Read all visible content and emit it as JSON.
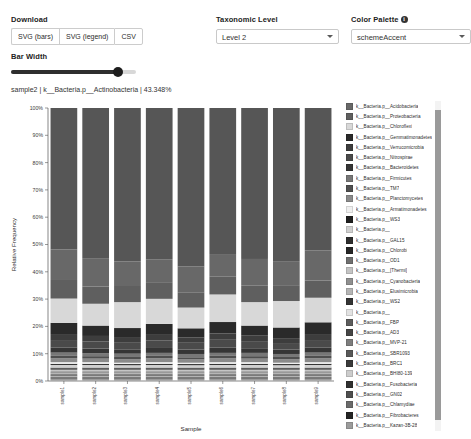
{
  "toolbar": {
    "download_label": "Download",
    "buttons": [
      {
        "label": "SVG (bars)",
        "name": "svg-bars"
      },
      {
        "label": "SVG (legend)",
        "name": "svg-legend"
      },
      {
        "label": "CSV",
        "name": "csv"
      }
    ],
    "bar_width_label": "Bar Width",
    "bar_width_value": "86",
    "taxonomic_level_label": "Taxonomic Level",
    "taxonomic_level_value": "Level 2",
    "color_palette_label": "Color Palette",
    "color_palette_value": "schemeAccent",
    "info_glyph": "i"
  },
  "status": {
    "text": "sample2 | k__Bacteria.p__Actinobacteria | 43.348%"
  },
  "chart_data": {
    "type": "bar",
    "title": "",
    "xlabel": "Sample",
    "ylabel": "Relative Frequency",
    "ylim": [
      0,
      1
    ],
    "grid": false,
    "legend_position": "right",
    "ytick_labels": [
      "0%",
      "10%",
      "20%",
      "30%",
      "40%",
      "50%",
      "60%",
      "70%",
      "80%",
      "90%",
      "100%"
    ],
    "ytick_values": [
      0,
      0.1,
      0.2,
      0.3,
      0.4,
      0.5,
      0.6,
      0.7,
      0.8,
      0.9,
      1.0
    ],
    "categories": [
      "sample1",
      "sample2",
      "sample3",
      "sample4",
      "sample5",
      "sample6",
      "sample7",
      "sample8",
      "sample9"
    ],
    "series": [
      {
        "name": "k__Bacteria.p__Acidobacteria",
        "color": "#686868",
        "values": [
          0.112,
          0.104,
          0.09,
          0.084,
          0.095,
          0.083,
          0.098,
          0.088,
          0.11
        ]
      },
      {
        "name": "k__Bacteria.p__Proteobacteria",
        "color": "#5f5f5f",
        "values": [
          0.068,
          0.063,
          0.059,
          0.061,
          0.056,
          0.065,
          0.06,
          0.058,
          0.063
        ]
      },
      {
        "name": "k__Bacteria.p__Chloroflexi",
        "color": "#d8d8d8",
        "values": [
          0.089,
          0.08,
          0.095,
          0.092,
          0.076,
          0.101,
          0.086,
          0.097,
          0.09
        ]
      },
      {
        "name": "k__Bacteria.p__Gemmatimonadetes",
        "color": "#2a2a2a",
        "values": [
          0.041,
          0.038,
          0.036,
          0.04,
          0.034,
          0.042,
          0.037,
          0.039,
          0.043
        ]
      },
      {
        "name": "k__Bacteria.p__Verrucomicrobia",
        "color": "#3d3d3d",
        "values": [
          0.022,
          0.02,
          0.018,
          0.021,
          0.019,
          0.023,
          0.02,
          0.018,
          0.022
        ]
      },
      {
        "name": "k__Bacteria.p__Nitrospirae",
        "color": "#4a4a4a",
        "values": [
          0.028,
          0.026,
          0.024,
          0.027,
          0.025,
          0.029,
          0.026,
          0.024,
          0.028
        ]
      },
      {
        "name": "k__Bacteria.p__Bacteroidetes",
        "color": "#353535",
        "values": [
          0.018,
          0.017,
          0.016,
          0.018,
          0.016,
          0.019,
          0.017,
          0.016,
          0.018
        ]
      },
      {
        "name": "k__Bacteria.p__Firmicutes",
        "color": "#777777",
        "values": [
          0.012,
          0.011,
          0.012,
          0.011,
          0.012,
          0.011,
          0.012,
          0.011,
          0.012
        ]
      },
      {
        "name": "k__Bacteria.p__TM7",
        "color": "#4f4f4f",
        "values": [
          0.009,
          0.009,
          0.008,
          0.009,
          0.008,
          0.009,
          0.009,
          0.008,
          0.009
        ]
      },
      {
        "name": "k__Bacteria.p__Planctomycetes",
        "color": "#8a8a8a",
        "values": [
          0.014,
          0.013,
          0.013,
          0.014,
          0.012,
          0.014,
          0.013,
          0.013,
          0.014
        ]
      },
      {
        "name": "k__Bacteria.p__Armatimonadetes",
        "color": "#efefef",
        "values": [
          0.006,
          0.006,
          0.005,
          0.006,
          0.005,
          0.006,
          0.006,
          0.005,
          0.006
        ]
      },
      {
        "name": "k__Bacteria.p__WS3",
        "color": "#1f1f1f",
        "values": [
          0.004,
          0.004,
          0.004,
          0.004,
          0.004,
          0.004,
          0.004,
          0.004,
          0.004
        ]
      },
      {
        "name": "k__Bacteria.p__",
        "color": "#d0d0d0",
        "values": [
          0.01,
          0.01,
          0.009,
          0.01,
          0.009,
          0.01,
          0.01,
          0.009,
          0.01
        ]
      },
      {
        "name": "k__Bacteria.p__GAL15",
        "color": "#2e2e2e",
        "values": [
          0.003,
          0.003,
          0.003,
          0.003,
          0.003,
          0.003,
          0.003,
          0.003,
          0.003
        ]
      },
      {
        "name": "k__Bacteria.p__Chlorobi",
        "color": "#262626",
        "values": [
          0.003,
          0.003,
          0.003,
          0.003,
          0.003,
          0.003,
          0.003,
          0.003,
          0.003
        ]
      },
      {
        "name": "k__Bacteria.p__OD1",
        "color": "#6f6f6f",
        "values": [
          0.003,
          0.003,
          0.003,
          0.003,
          0.003,
          0.003,
          0.003,
          0.003,
          0.003
        ]
      },
      {
        "name": "k__Bacteria.p__[Thermi]",
        "color": "#c4c4c4",
        "values": [
          0.003,
          0.003,
          0.003,
          0.003,
          0.003,
          0.003,
          0.003,
          0.003,
          0.003
        ]
      },
      {
        "name": "k__Bacteria.p__Cyanobacteria",
        "color": "#8f8f8f",
        "values": [
          0.003,
          0.003,
          0.003,
          0.003,
          0.003,
          0.003,
          0.003,
          0.003,
          0.003
        ]
      },
      {
        "name": "k__Bacteria.p__Elusimicrobia",
        "color": "#b5b5b5",
        "values": [
          0.002,
          0.002,
          0.002,
          0.002,
          0.002,
          0.002,
          0.002,
          0.002,
          0.002
        ]
      },
      {
        "name": "k__Bacteria.p__WS2",
        "color": "#343434",
        "values": [
          0.002,
          0.002,
          0.002,
          0.002,
          0.002,
          0.002,
          0.002,
          0.002,
          0.002
        ]
      },
      {
        "name": "k__Bacteria.p__",
        "color": "#e2e2e2",
        "values": [
          0.002,
          0.002,
          0.002,
          0.002,
          0.002,
          0.002,
          0.002,
          0.002,
          0.002
        ]
      },
      {
        "name": "k__Bacteria.p__FBP",
        "color": "#5c5c5c",
        "values": [
          0.002,
          0.002,
          0.002,
          0.002,
          0.002,
          0.002,
          0.002,
          0.002,
          0.002
        ]
      },
      {
        "name": "k__Bacteria.p__AD3",
        "color": "#454545",
        "values": [
          0.002,
          0.002,
          0.002,
          0.002,
          0.002,
          0.002,
          0.002,
          0.002,
          0.002
        ]
      },
      {
        "name": "k__Bacteria.p__MVP-21",
        "color": "#7d7d7d",
        "values": [
          0.002,
          0.002,
          0.002,
          0.002,
          0.002,
          0.002,
          0.002,
          0.002,
          0.002
        ]
      },
      {
        "name": "k__Bacteria.p__SBR1093",
        "color": "#585858",
        "values": [
          0.002,
          0.002,
          0.002,
          0.002,
          0.002,
          0.002,
          0.002,
          0.002,
          0.002
        ]
      },
      {
        "name": "k__Bacteria.p__BRC1",
        "color": "#3a3a3a",
        "values": [
          0.002,
          0.002,
          0.002,
          0.002,
          0.002,
          0.002,
          0.002,
          0.002,
          0.002
        ]
      },
      {
        "name": "k__Bacteria.p__BHI80-139",
        "color": "#cccccc",
        "values": [
          0.002,
          0.002,
          0.002,
          0.002,
          0.002,
          0.002,
          0.002,
          0.002,
          0.002
        ]
      },
      {
        "name": "k__Bacteria.p__Fusobacteria",
        "color": "#303030",
        "values": [
          0.002,
          0.002,
          0.002,
          0.002,
          0.002,
          0.002,
          0.002,
          0.002,
          0.002
        ]
      },
      {
        "name": "k__Bacteria.p__GN02",
        "color": "#4e4e4e",
        "values": [
          0.002,
          0.002,
          0.002,
          0.002,
          0.002,
          0.002,
          0.002,
          0.002,
          0.002
        ]
      },
      {
        "name": "k__Bacteria.p__Chlamydiae",
        "color": "#6a6a6a",
        "values": [
          0.002,
          0.002,
          0.002,
          0.002,
          0.002,
          0.002,
          0.002,
          0.002,
          0.002
        ]
      },
      {
        "name": "k__Bacteria.p__Fibrobacteres",
        "color": "#242424",
        "values": [
          0.002,
          0.002,
          0.002,
          0.002,
          0.002,
          0.002,
          0.002,
          0.002,
          0.002
        ]
      },
      {
        "name": "k__Bacteria.p__Kazan-3B-28",
        "color": "#9b9b9b",
        "values": [
          0.002,
          0.002,
          0.002,
          0.002,
          0.002,
          0.002,
          0.002,
          0.002,
          0.002
        ]
      },
      {
        "name": "k__Bacteria.p__WS6",
        "color": "#535353",
        "values": [
          0.002,
          0.002,
          0.002,
          0.002,
          0.002,
          0.002,
          0.002,
          0.002,
          0.002
        ]
      },
      {
        "name": "k__Bacteria.p__FCPU426",
        "color": "#7a7a7a",
        "values": [
          0.002,
          0.002,
          0.002,
          0.002,
          0.002,
          0.002,
          0.002,
          0.002,
          0.002
        ]
      },
      {
        "name": "k__Bacteria.p__WPS-2",
        "color": "#dcdcdc",
        "values": [
          0.002,
          0.002,
          0.002,
          0.002,
          0.002,
          0.002,
          0.002,
          0.002,
          0.002
        ]
      }
    ],
    "top_series": {
      "name": "k__Bacteria.p__Actinobacteria",
      "color": "#565656"
    }
  },
  "legend": {
    "items": [
      {
        "label": "k__Bacteria.p__Acidobacteria",
        "color": "#686868"
      },
      {
        "label": "k__Bacteria.p__Proteobacteria",
        "color": "#5f5f5f"
      },
      {
        "label": "k__Bacteria.p__Chloroflexi",
        "color": "#d8d8d8"
      },
      {
        "label": "k__Bacteria.p__Gemmatimonadetes",
        "color": "#2a2a2a"
      },
      {
        "label": "k__Bacteria.p__Verrucomicrobia",
        "color": "#3d3d3d"
      },
      {
        "label": "k__Bacteria.p__Nitrospirae",
        "color": "#4a4a4a"
      },
      {
        "label": "k__Bacteria.p__Bacteroidetes",
        "color": "#353535"
      },
      {
        "label": "k__Bacteria.p__Firmicutes",
        "color": "#777777"
      },
      {
        "label": "k__Bacteria.p__TM7",
        "color": "#4f4f4f"
      },
      {
        "label": "k__Bacteria.p__Planctomycetes",
        "color": "#8a8a8a"
      },
      {
        "label": "k__Bacteria.p__Armatimonadetes",
        "color": "#efefef"
      },
      {
        "label": "k__Bacteria.p__WS3",
        "color": "#1f1f1f"
      },
      {
        "label": "k__Bacteria.p__",
        "color": "#d0d0d0"
      },
      {
        "label": "k__Bacteria.p__GAL15",
        "color": "#2e2e2e"
      },
      {
        "label": "k__Bacteria.p__Chlorobi",
        "color": "#262626"
      },
      {
        "label": "k__Bacteria.p__OD1",
        "color": "#6f6f6f"
      },
      {
        "label": "k__Bacteria.p__[Thermi]",
        "color": "#c4c4c4"
      },
      {
        "label": "k__Bacteria.p__Cyanobacteria",
        "color": "#8f8f8f"
      },
      {
        "label": "k__Bacteria.p__Elusimicrobia",
        "color": "#b5b5b5"
      },
      {
        "label": "k__Bacteria.p__WS2",
        "color": "#343434"
      },
      {
        "label": "k__Bacteria.p__",
        "color": "#e2e2e2"
      },
      {
        "label": "k__Bacteria.p__FBP",
        "color": "#5c5c5c"
      },
      {
        "label": "k__Bacteria.p__AD3",
        "color": "#454545"
      },
      {
        "label": "k__Bacteria.p__MVP-21",
        "color": "#7d7d7d"
      },
      {
        "label": "k__Bacteria.p__SBR1093",
        "color": "#585858"
      },
      {
        "label": "k__Bacteria.p__BRC1",
        "color": "#3a3a3a"
      },
      {
        "label": "k__Bacteria.p__BHI80-139",
        "color": "#cccccc"
      },
      {
        "label": "k__Bacteria.p__Fusobacteria",
        "color": "#303030"
      },
      {
        "label": "k__Bacteria.p__GN02",
        "color": "#4e4e4e"
      },
      {
        "label": "k__Bacteria.p__Chlamydiae",
        "color": "#6a6a6a"
      },
      {
        "label": "k__Bacteria.p__Fibrobacteres",
        "color": "#242424"
      },
      {
        "label": "k__Bacteria.p__Kazan-3B-28",
        "color": "#9b9b9b"
      },
      {
        "label": "k__Bacteria.p__WS6",
        "color": "#535353"
      },
      {
        "label": "k__Bacteria.p__FCPU426",
        "color": "#7a7a7a"
      },
      {
        "label": "k__Bacteria.p__WPS-2",
        "color": "#dcdcdc"
      }
    ]
  }
}
